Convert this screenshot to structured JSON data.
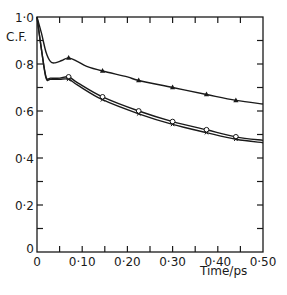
{
  "chart_data": {
    "type": "line",
    "title": "",
    "xlabel": "Time/ps",
    "ylabel": "C.F.",
    "xlim": [
      0,
      0.5
    ],
    "ylim": [
      0,
      1.0
    ],
    "grid": false,
    "legend": null,
    "x_ticks": [
      0,
      0.05,
      0.1,
      0.15,
      0.2,
      0.25,
      0.3,
      0.35,
      0.4,
      0.45,
      0.5
    ],
    "x_tick_labels": [
      {
        "value": 0,
        "label": "0"
      },
      {
        "value": 0.1,
        "label": "0·10"
      },
      {
        "value": 0.2,
        "label": "0·20"
      },
      {
        "value": 0.3,
        "label": "0·30"
      },
      {
        "value": 0.4,
        "label": "0·40"
      },
      {
        "value": 0.5,
        "label": "0·50"
      }
    ],
    "y_ticks": [
      0,
      0.1,
      0.2,
      0.3,
      0.4,
      0.5,
      0.6,
      0.7,
      0.8,
      0.9,
      1.0
    ],
    "y_tick_labels": [
      {
        "value": 0,
        "label": "0"
      },
      {
        "value": 0.2,
        "label": "0·2"
      },
      {
        "value": 0.4,
        "label": "0·4"
      },
      {
        "value": 0.6,
        "label": "0·6"
      },
      {
        "value": 0.8,
        "label": "0·8"
      },
      {
        "value": 1.0,
        "label": "1·0"
      }
    ],
    "series": [
      {
        "name": "triangle",
        "marker": "filled-triangle",
        "curve": [
          [
            0,
            1.0
          ],
          [
            0.01,
            0.93
          ],
          [
            0.02,
            0.85
          ],
          [
            0.03,
            0.81
          ],
          [
            0.04,
            0.805
          ],
          [
            0.055,
            0.815
          ],
          [
            0.07,
            0.826
          ],
          [
            0.09,
            0.81
          ],
          [
            0.11,
            0.79
          ],
          [
            0.145,
            0.77
          ],
          [
            0.2,
            0.745
          ],
          [
            0.225,
            0.73
          ],
          [
            0.3,
            0.7
          ],
          [
            0.375,
            0.67
          ],
          [
            0.44,
            0.645
          ],
          [
            0.5,
            0.63
          ]
        ],
        "markers": [
          [
            0.07,
            0.826
          ],
          [
            0.145,
            0.77
          ],
          [
            0.225,
            0.73
          ],
          [
            0.3,
            0.7
          ],
          [
            0.375,
            0.67
          ],
          [
            0.44,
            0.645
          ]
        ]
      },
      {
        "name": "open-circle",
        "marker": "open-circle",
        "curve": [
          [
            0,
            1.0
          ],
          [
            0.01,
            0.86
          ],
          [
            0.02,
            0.745
          ],
          [
            0.03,
            0.74
          ],
          [
            0.05,
            0.74
          ],
          [
            0.07,
            0.745
          ],
          [
            0.09,
            0.72
          ],
          [
            0.145,
            0.66
          ],
          [
            0.225,
            0.6
          ],
          [
            0.3,
            0.555
          ],
          [
            0.375,
            0.52
          ],
          [
            0.44,
            0.49
          ],
          [
            0.5,
            0.475
          ]
        ],
        "markers": [
          [
            0.07,
            0.745
          ],
          [
            0.145,
            0.66
          ],
          [
            0.225,
            0.6
          ],
          [
            0.3,
            0.555
          ],
          [
            0.375,
            0.52
          ],
          [
            0.44,
            0.49
          ]
        ]
      },
      {
        "name": "cross",
        "marker": "small-cross",
        "curve": [
          [
            0,
            1.0
          ],
          [
            0.01,
            0.86
          ],
          [
            0.02,
            0.74
          ],
          [
            0.03,
            0.735
          ],
          [
            0.05,
            0.735
          ],
          [
            0.07,
            0.735
          ],
          [
            0.09,
            0.71
          ],
          [
            0.145,
            0.648
          ],
          [
            0.225,
            0.588
          ],
          [
            0.3,
            0.543
          ],
          [
            0.375,
            0.508
          ],
          [
            0.44,
            0.48
          ],
          [
            0.5,
            0.465
          ]
        ],
        "markers": [
          [
            0.07,
            0.735
          ],
          [
            0.145,
            0.648
          ],
          [
            0.225,
            0.588
          ],
          [
            0.3,
            0.543
          ],
          [
            0.375,
            0.508
          ],
          [
            0.44,
            0.48
          ]
        ]
      }
    ]
  },
  "labels": {
    "ylabel": "C.F.",
    "xlabel": "Time/ps",
    "y_origin": "0"
  }
}
